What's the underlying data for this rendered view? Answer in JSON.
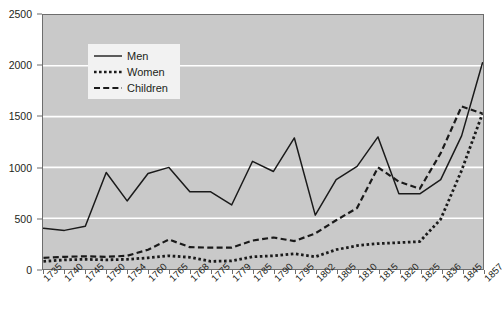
{
  "chart_data": {
    "type": "line",
    "title": "",
    "xlabel": "",
    "ylabel": "",
    "ylim": [
      0,
      2500
    ],
    "yticks": [
      0,
      500,
      1000,
      1500,
      2000,
      2500
    ],
    "grid": true,
    "legend_position": "top-left-inside",
    "categories": [
      "1735",
      "1740",
      "1745",
      "1750",
      "1754",
      "1760",
      "1765",
      "1768",
      "1775",
      "1779",
      "1785",
      "1790",
      "1795",
      "1802",
      "1805",
      "1810",
      "1815",
      "1820",
      "1825",
      "1836",
      "1845",
      "1857"
    ],
    "series": [
      {
        "name": "Men",
        "style": "solid",
        "color": "#1a1a1a",
        "values": [
          400,
          380,
          420,
          950,
          670,
          940,
          1000,
          760,
          760,
          630,
          1060,
          960,
          1290,
          530,
          880,
          1010,
          1300,
          740,
          740,
          880,
          1310,
          2030
        ]
      },
      {
        "name": "Women",
        "style": "dotted",
        "color": "#1a1a1a",
        "values": [
          75,
          90,
          95,
          90,
          95,
          110,
          130,
          115,
          75,
          80,
          120,
          130,
          150,
          120,
          190,
          230,
          250,
          260,
          270,
          490,
          970,
          1530
        ]
      },
      {
        "name": "Children",
        "style": "dashed",
        "color": "#1a1a1a",
        "values": [
          110,
          120,
          125,
          120,
          130,
          190,
          290,
          215,
          210,
          210,
          280,
          310,
          275,
          350,
          480,
          600,
          1000,
          860,
          790,
          1140,
          1600,
          1530
        ]
      }
    ]
  },
  "legend": {
    "items": [
      {
        "label": "Men",
        "key": "solid-line-key"
      },
      {
        "label": "Women",
        "key": "dotted-line-key"
      },
      {
        "label": "Children",
        "key": "dashed-line-key"
      }
    ]
  },
  "colors": {
    "plot_background": "#c9c9c9",
    "gridline": "#ffffff",
    "axis": "#6d6d6d",
    "text": "#231f20",
    "legend_background": "#f2f2f2",
    "series_line": "#1a1a1a"
  }
}
